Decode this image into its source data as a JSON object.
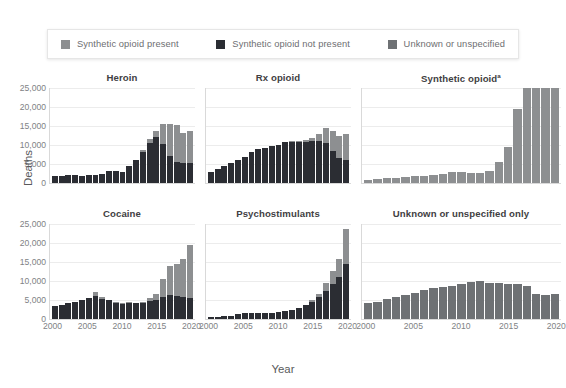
{
  "legend": {
    "items": [
      {
        "label": "Synthetic opioid present",
        "color": "#8d8f91",
        "name": "synthetic-present"
      },
      {
        "label": "Synthetic opioid not present",
        "color": "#2b2d33",
        "name": "synthetic-not-present"
      },
      {
        "label": "Unknown or unspecified",
        "color": "#6e7174",
        "name": "unknown-unspecified"
      }
    ]
  },
  "axes": {
    "y_title": "Deaths",
    "x_title": "Year"
  },
  "chart_data": {
    "type": "bar",
    "title": "",
    "subtitle": "",
    "xlabel": "Year",
    "ylabel": "Deaths",
    "ylim": [
      0,
      25000
    ],
    "yticks": [
      0,
      5000,
      10000,
      15000,
      20000,
      25000
    ],
    "ytick_labels": [
      "0",
      "5,000",
      "10,000",
      "15,000",
      "20,000",
      "25,000"
    ],
    "xticks": [
      2000,
      2005,
      2010,
      2015,
      2020
    ],
    "xtick_labels": [
      "2000",
      "2005",
      "2010",
      "2015",
      "2020"
    ],
    "grid": true,
    "stacked": true,
    "legend_position": "top",
    "x": [
      2000,
      2001,
      2002,
      2003,
      2004,
      2005,
      2006,
      2007,
      2008,
      2009,
      2010,
      2011,
      2012,
      2013,
      2014,
      2015,
      2016,
      2017,
      2018,
      2019,
      2020
    ],
    "series_names": [
      "Synthetic opioid not present",
      "Synthetic opioid present",
      "Unknown or unspecified"
    ],
    "colors": {
      "synthetic_not_present": "#2b2d33",
      "synthetic_present": "#8d8f91",
      "unknown_unspecified": "#6e7174"
    },
    "panels": [
      {
        "title": "Heroin",
        "title_superscript": "",
        "show_xlabels": false,
        "series": [
          {
            "name": "Synthetic opioid not present",
            "key": "synthetic_not_present",
            "values": [
              1800,
              1780,
              2090,
              2080,
              1880,
              2010,
              2090,
              2400,
              3040,
              3280,
              3020,
              4400,
              5930,
              8260,
              10560,
              12120,
              10240,
              7220,
              5660,
              5150,
              5300
            ]
          },
          {
            "name": "Synthetic opioid present",
            "key": "synthetic_present",
            "values": [
              0,
              0,
              0,
              0,
              0,
              0,
              0,
              0,
              0,
              0,
              0,
              0,
              200,
              500,
              900,
              1500,
              5260,
              8300,
              9600,
              8000,
              8400
            ]
          }
        ]
      },
      {
        "title": "Rx opioid",
        "title_superscript": "",
        "show_xlabels": false,
        "series": [
          {
            "name": "Synthetic opioid not present",
            "key": "synthetic_not_present",
            "values": [
              2900,
              3600,
              4400,
              5200,
              6000,
              6800,
              8200,
              9000,
              9200,
              9700,
              10100,
              10900,
              10800,
              10700,
              10900,
              11100,
              11100,
              10400,
              8300,
              6600,
              6100
            ]
          },
          {
            "name": "Synthetic opioid present",
            "key": "synthetic_present",
            "values": [
              0,
              0,
              0,
              0,
              0,
              0,
              0,
              0,
              0,
              0,
              0,
              0,
              200,
              300,
              500,
              800,
              1900,
              4100,
              5500,
              5700,
              6900
            ]
          }
        ]
      },
      {
        "title": "Synthetic opioid",
        "title_superscript": "a",
        "show_xlabels": false,
        "series": [
          {
            "name": "Synthetic opioid present",
            "key": "synthetic_present",
            "values": [
              730,
              950,
              1300,
              1400,
              1660,
              1740,
              1800,
              2200,
              2300,
              2900,
              3000,
              2600,
              2630,
              3100,
              5540,
              9580,
              19410,
              28470,
              31335,
              36359,
              56516
            ]
          }
        ],
        "clip_note": "series exceeds ylim; bars clipped at 25,000"
      },
      {
        "title": "Cocaine",
        "title_superscript": "",
        "show_xlabels": true,
        "series": [
          {
            "name": "Synthetic opioid not present",
            "key": "synthetic_not_present",
            "values": [
              3500,
              3700,
              4300,
              4600,
              4900,
              5500,
              6100,
              5300,
              4900,
              4200,
              4000,
              4300,
              4200,
              4300,
              4700,
              5100,
              5700,
              6300,
              6000,
              5700,
              5600
            ]
          },
          {
            "name": "Synthetic opioid present",
            "key": "synthetic_present",
            "values": [
              0,
              0,
              0,
              0,
              0,
              0,
              900,
              600,
              200,
              200,
              100,
              100,
              100,
              300,
              900,
              1500,
              4700,
              7600,
              8600,
              10200,
              13900
            ]
          }
        ]
      },
      {
        "title": "Psychostimulants",
        "title_superscript": "",
        "show_xlabels": true,
        "series": [
          {
            "name": "Synthetic opioid not present",
            "key": "synthetic_not_present",
            "values": [
              400,
              500,
              700,
              900,
              1200,
              1500,
              1700,
              1600,
              1600,
              1600,
              1800,
              2100,
              2400,
              2900,
              3600,
              4600,
              5800,
              7500,
              9100,
              11000,
              14600
            ]
          },
          {
            "name": "Synthetic opioid present",
            "key": "synthetic_present",
            "values": [
              0,
              0,
              0,
              0,
              0,
              0,
              0,
              0,
              0,
              0,
              0,
              0,
              100,
              100,
              200,
              400,
              900,
              2100,
              3500,
              4800,
              9100
            ]
          }
        ]
      },
      {
        "title": "Unknown or unspecified only",
        "title_superscript": "",
        "show_xlabels": true,
        "series": [
          {
            "name": "Unknown or unspecified",
            "key": "unknown_unspecified",
            "values": [
              4300,
              4600,
              5200,
              5700,
              6200,
              6800,
              7600,
              8200,
              8500,
              8700,
              9100,
              9700,
              10000,
              9600,
              9400,
              9200,
              9100,
              8600,
              6700,
              6300,
              6700
            ]
          }
        ]
      }
    ]
  }
}
